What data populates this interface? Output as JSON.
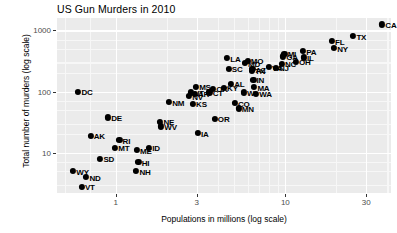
{
  "chart_data": {
    "type": "scatter",
    "title": "US Gun Murders in 2010",
    "xlabel": "Populations in millions (log scale)",
    "ylabel": "Total number of murders (log scale)",
    "xscale": "log",
    "yscale": "log",
    "xlim": [
      0.45,
      42
    ],
    "ylim": [
      2.2,
      1600
    ],
    "xticks": [
      1,
      3,
      10,
      30
    ],
    "xtick_labels": [
      "1",
      "3",
      "10",
      "30"
    ],
    "yticks": [
      10,
      100,
      1000
    ],
    "ytick_labels": [
      "10",
      "100",
      "1000"
    ],
    "grid": true,
    "legend": "none",
    "point_color": "#000000",
    "panel_color": "#ebebeb",
    "gridline_color": "#ffffff",
    "points": [
      {
        "label": "CA",
        "x": 37.25,
        "y": 1257
      },
      {
        "label": "TX",
        "x": 25.15,
        "y": 805
      },
      {
        "label": "FL",
        "x": 18.8,
        "y": 669
      },
      {
        "label": "NY",
        "x": 19.38,
        "y": 517
      },
      {
        "label": "PA",
        "x": 12.7,
        "y": 457
      },
      {
        "label": "MI",
        "x": 9.88,
        "y": 413
      },
      {
        "label": "IL",
        "x": 12.83,
        "y": 364
      },
      {
        "label": "OH",
        "x": 11.54,
        "y": 310
      },
      {
        "label": "GA",
        "x": 9.69,
        "y": 376
      },
      {
        "label": "NC",
        "x": 9.53,
        "y": 286
      },
      {
        "label": "LA",
        "x": 4.53,
        "y": 351
      },
      {
        "label": "MO",
        "x": 5.99,
        "y": 321
      },
      {
        "label": "SC",
        "x": 4.63,
        "y": 237
      },
      {
        "label": "TN",
        "x": 6.35,
        "y": 219
      },
      {
        "label": "MD",
        "x": 5.77,
        "y": 293
      },
      {
        "label": "VA",
        "x": 8.0,
        "y": 250
      },
      {
        "label": "NJ",
        "x": 8.79,
        "y": 246
      },
      {
        "label": "AZ",
        "x": 6.39,
        "y": 232
      },
      {
        "label": "IN",
        "x": 6.48,
        "y": 156
      },
      {
        "label": "AL",
        "x": 4.78,
        "y": 135
      },
      {
        "label": "WA",
        "x": 6.72,
        "y": 93
      },
      {
        "label": "MN",
        "x": 5.3,
        "y": 53
      },
      {
        "label": "CO",
        "x": 5.03,
        "y": 65
      },
      {
        "label": "WI",
        "x": 5.69,
        "y": 97
      },
      {
        "label": "MA",
        "x": 6.55,
        "y": 118
      },
      {
        "label": "MS",
        "x": 2.97,
        "y": 120
      },
      {
        "label": "OK",
        "x": 3.75,
        "y": 111
      },
      {
        "label": "AR",
        "x": 2.92,
        "y": 93
      },
      {
        "label": "CT",
        "x": 3.57,
        "y": 97
      },
      {
        "label": "KY",
        "x": 4.34,
        "y": 116
      },
      {
        "label": "UT",
        "x": 2.76,
        "y": 97
      },
      {
        "label": "NM",
        "x": 2.06,
        "y": 67
      },
      {
        "label": "KS",
        "x": 2.85,
        "y": 63
      },
      {
        "label": "OR",
        "x": 3.83,
        "y": 36
      },
      {
        "label": "IA",
        "x": 3.05,
        "y": 21
      },
      {
        "label": "NE",
        "x": 1.83,
        "y": 32
      },
      {
        "label": "NV",
        "x": 2.7,
        "y": 84
      },
      {
        "label": "WV",
        "x": 1.85,
        "y": 27
      },
      {
        "label": "DC",
        "x": 0.6,
        "y": 99
      },
      {
        "label": "DE",
        "x": 0.9,
        "y": 38
      },
      {
        "label": "AK",
        "x": 0.71,
        "y": 19
      },
      {
        "label": "RI",
        "x": 1.05,
        "y": 16
      },
      {
        "label": "MT",
        "x": 0.99,
        "y": 12
      },
      {
        "label": "ID",
        "x": 1.57,
        "y": 12
      },
      {
        "label": "ME",
        "x": 1.33,
        "y": 11
      },
      {
        "label": "SD",
        "x": 0.81,
        "y": 8
      },
      {
        "label": "HI",
        "x": 1.36,
        "y": 7
      },
      {
        "label": "NH",
        "x": 1.32,
        "y": 5
      },
      {
        "label": "WY",
        "x": 0.56,
        "y": 5
      },
      {
        "label": "ND",
        "x": 0.67,
        "y": 4
      },
      {
        "label": "VT",
        "x": 0.63,
        "y": 2.8
      }
    ]
  }
}
